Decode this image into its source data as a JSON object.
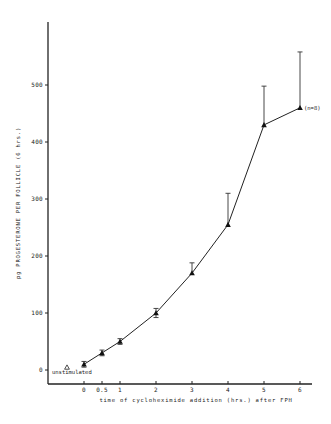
{
  "chart_data": {
    "type": "line",
    "title": "",
    "xlabel": "time of cycloheximide addition (hrs.) after FPH",
    "ylabel": "pg PROGESTERONE PER FOLLICLE (6 hrs.)",
    "xlim": [
      0,
      6
    ],
    "ylim": [
      0,
      600
    ],
    "x_ticks": [
      0,
      0.5,
      1,
      2,
      3,
      4,
      5,
      6
    ],
    "x_tick_labels": [
      "0",
      "0.5",
      "1",
      "2",
      "3",
      "4",
      "5",
      "6"
    ],
    "y_ticks": [
      0,
      100,
      200,
      300,
      400,
      500
    ],
    "y_tick_labels": [
      "0",
      "100",
      "200",
      "300",
      "400",
      "500"
    ],
    "grid": false,
    "legend": null,
    "series": [
      {
        "name": "cycloheximide addition",
        "marker": "filled-triangle",
        "x": [
          0,
          0.5,
          1,
          2,
          3,
          4,
          5,
          6
        ],
        "y": [
          10,
          30,
          50,
          100,
          170,
          255,
          430,
          460
        ],
        "error_upper": [
          5,
          5,
          5,
          8,
          18,
          55,
          68,
          98
        ]
      }
    ],
    "reference_points": [
      {
        "label": "unstimulated",
        "marker": "open-triangle",
        "y": 3
      }
    ],
    "annotations": [
      {
        "text": "(n=8)",
        "x": 6,
        "y": 460
      }
    ]
  }
}
